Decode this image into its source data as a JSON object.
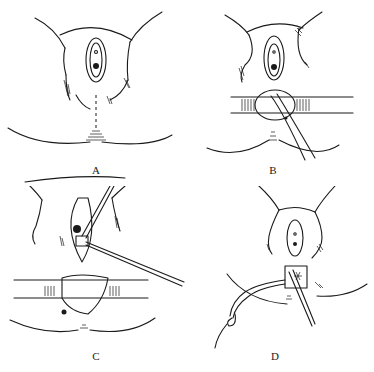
{
  "figure": {
    "panels": [
      {
        "id": "A",
        "label": "A"
      },
      {
        "id": "B",
        "label": "B"
      },
      {
        "id": "C",
        "label": "C"
      },
      {
        "id": "D",
        "label": "D"
      }
    ]
  },
  "colors": {
    "ink": "#1a1a1a",
    "background": "#ffffff"
  }
}
